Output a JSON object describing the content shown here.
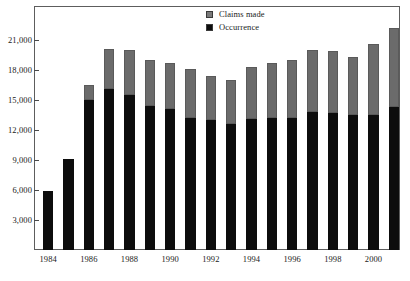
{
  "chart_data": {
    "type": "bar",
    "subtype": "stacked-vertical",
    "title": "",
    "subtitle": "",
    "xlabel": "",
    "ylabel": "",
    "ylim": [
      0,
      24000
    ],
    "grid": false,
    "legend_position": "top-center",
    "y_ticks": [
      "3,000",
      "6,000",
      "9,000",
      "12,000",
      "15,000",
      "18,000",
      "21,000"
    ],
    "y_tick_values": [
      3000,
      6000,
      9000,
      12000,
      15000,
      18000,
      21000
    ],
    "categories": [
      "1984",
      "1985",
      "1986",
      "1987",
      "1988",
      "1989",
      "1990",
      "1991",
      "1992",
      "1993",
      "1994",
      "1995",
      "1996",
      "1997",
      "1998",
      "1999",
      "2000",
      "2001"
    ],
    "x_tick_labels": [
      "1984",
      "1986",
      "1988",
      "1990",
      "1992",
      "1994",
      "1996",
      "1998",
      "2000"
    ],
    "x_tick_categories": [
      "1984",
      "1986",
      "1988",
      "1990",
      "1992",
      "1994",
      "1996",
      "1998",
      "2000"
    ],
    "series": [
      {
        "name": "Occurrence",
        "color": "#0d0d0d",
        "values": [
          5900,
          9100,
          15000,
          16100,
          15500,
          14400,
          14100,
          13200,
          13000,
          12600,
          13100,
          13200,
          13200,
          13800,
          13700,
          13500,
          13500,
          14300
        ]
      },
      {
        "name": "Claims made",
        "color": "#6b6b6b",
        "values": [
          0,
          0,
          1500,
          4000,
          4500,
          4600,
          4600,
          4900,
          4400,
          4400,
          5200,
          5500,
          5800,
          6200,
          6200,
          5800,
          7100,
          7900
        ]
      }
    ],
    "totals": [
      5900,
      9100,
      16500,
      20100,
      20000,
      19000,
      18700,
      18100,
      17400,
      17000,
      18300,
      18700,
      19000,
      20000,
      19900,
      19300,
      20600,
      22200
    ]
  },
  "legend": {
    "items": [
      {
        "label": "Claims made",
        "swatch": "gray-swatch"
      },
      {
        "label": "Occurrence",
        "swatch": "black-swatch"
      }
    ]
  }
}
